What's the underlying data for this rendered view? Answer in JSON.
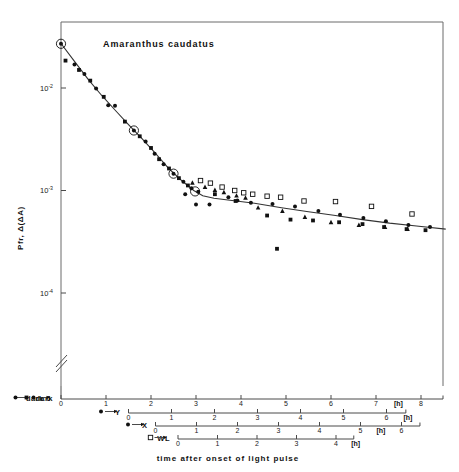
{
  "figure": {
    "title": "Amaranthus caudatus",
    "y_axis_title": "Pfr, Δ(ΔA)",
    "x_caption": "time after onset of light pulse",
    "unit_label": "[h]",
    "axis_break_symbol": "//"
  },
  "chart_data": {
    "type": "scatter",
    "title": "Amaranthus caudatus",
    "xlabel": "time after onset of light pulse",
    "ylabel": "Pfr, Δ(ΔA)",
    "yscale": "log",
    "ylim": [
      3e-05,
      0.04
    ],
    "ytick_values": [
      0.01,
      0.001,
      0.0001
    ],
    "ytick_labels": [
      "10-2",
      "10-3",
      "10-4"
    ],
    "ytick_exponents": [
      "-2",
      "-3",
      "-4"
    ],
    "ytick_mantissa": "10",
    "grid": false,
    "legend_position": "below-axes",
    "xlim_hours_dark": [
      0,
      8.6
    ],
    "time_axes": [
      {
        "name": "dark",
        "label": "dark",
        "marker_left": "filled-circle",
        "marker_right": "filled-square",
        "start_hour_on_dark_scale": 0,
        "ticks": [
          0,
          1,
          2,
          3,
          4,
          5,
          6,
          7,
          8
        ],
        "tick_labels": [
          "0",
          "1",
          "2",
          "3",
          "4",
          "5",
          "6",
          "7",
          "8"
        ],
        "unit": "[h]",
        "unit_after_tick": 7
      },
      {
        "name": "Y",
        "label": "Y",
        "marker_left": "filled-circle",
        "marker_right": "filled-triangle",
        "start_hour_on_dark_scale": 1.5,
        "ticks": [
          0,
          1,
          2,
          3,
          4,
          5,
          6
        ],
        "tick_labels": [
          "0",
          "1",
          "2",
          "3",
          "4",
          "5",
          "6"
        ],
        "unit": "[h]",
        "unit_after_tick": 6
      },
      {
        "name": "X",
        "label": "X",
        "marker_left": "filled-circle",
        "marker_right": "filled-square",
        "start_hour_on_dark_scale": 2.1,
        "ticks": [
          0,
          1,
          2,
          3,
          4,
          5,
          6
        ],
        "tick_labels": [
          "0",
          "1",
          "2",
          "3",
          "4",
          "5",
          "6"
        ],
        "unit": "[h]",
        "unit_after_tick": 5
      },
      {
        "name": "WL",
        "label": "WL",
        "marker_left": "open-square",
        "marker_right": "open-square",
        "start_hour_on_dark_scale": 2.6,
        "ticks": [
          0,
          1,
          2,
          3,
          4
        ],
        "tick_labels": [
          "0",
          "1",
          "2",
          "3",
          "4"
        ],
        "unit": "[h]",
        "unit_after_tick": 4
      }
    ],
    "series": [
      {
        "name": "dark",
        "marker": "filled-circle",
        "points": [
          [
            0.0,
            0.027
          ],
          [
            0.3,
            0.017
          ],
          [
            0.52,
            0.0137
          ],
          [
            0.78,
            0.0099
          ],
          [
            1.05,
            0.0068
          ],
          [
            1.2,
            0.0067
          ],
          [
            1.62,
            0.00385
          ],
          [
            1.88,
            0.003
          ],
          [
            2.08,
            0.00228
          ],
          [
            2.28,
            0.0018
          ],
          [
            2.5,
            0.00146
          ],
          [
            2.72,
            0.00122
          ],
          [
            2.9,
            0.00105
          ],
          [
            3.05,
            0.00097
          ],
          [
            2.76,
            0.00092
          ],
          [
            3.0,
            0.00073
          ],
          [
            3.3,
            0.00073
          ],
          [
            3.72,
            0.00086
          ],
          [
            3.92,
            0.0008
          ],
          [
            4.22,
            0.00076
          ],
          [
            4.7,
            0.00074
          ],
          [
            5.2,
            0.0007
          ],
          [
            5.72,
            0.00063
          ],
          [
            6.2,
            0.00058
          ],
          [
            6.72,
            0.00054
          ],
          [
            7.22,
            0.0005
          ],
          [
            7.72,
            0.00046
          ],
          [
            8.2,
            0.00044
          ]
        ]
      },
      {
        "name": "Y",
        "marker": "filled-triangle",
        "points": [
          [
            2.92,
            0.00119
          ],
          [
            3.2,
            0.00108
          ],
          [
            3.42,
            0.00101
          ],
          [
            3.62,
            0.00096
          ],
          [
            3.9,
            0.00089
          ],
          [
            4.1,
            0.00085
          ],
          [
            4.38,
            0.00068
          ],
          [
            4.92,
            0.00063
          ],
          [
            5.42,
            0.00055
          ],
          [
            6.0,
            0.00049
          ],
          [
            6.62,
            0.00046
          ],
          [
            7.2,
            0.00044
          ],
          [
            7.7,
            0.00042
          ]
        ]
      },
      {
        "name": "X",
        "marker": "filled-square",
        "points": [
          [
            0.1,
            0.0185
          ],
          [
            0.4,
            0.015
          ],
          [
            0.65,
            0.0118
          ],
          [
            0.95,
            0.0082
          ],
          [
            1.42,
            0.0047
          ],
          [
            1.75,
            0.00338
          ],
          [
            2.0,
            0.0026
          ],
          [
            2.18,
            0.00202
          ],
          [
            2.4,
            0.00164
          ],
          [
            2.62,
            0.00132
          ],
          [
            2.82,
            0.00112
          ],
          [
            3.42,
            0.00092
          ],
          [
            3.88,
            0.00079
          ],
          [
            4.58,
            0.00057
          ],
          [
            5.1,
            0.00052
          ],
          [
            5.6,
            0.00051
          ],
          [
            6.18,
            0.00049
          ],
          [
            6.7,
            0.00047
          ],
          [
            7.18,
            0.00044
          ],
          [
            7.68,
            0.00042
          ],
          [
            8.1,
            0.00041
          ],
          [
            4.8,
            0.00027
          ]
        ]
      },
      {
        "name": "WL",
        "marker": "open-square",
        "points": [
          [
            3.1,
            0.00125
          ],
          [
            3.32,
            0.00118
          ],
          [
            3.58,
            0.00108
          ],
          [
            3.86,
            0.001
          ],
          [
            4.06,
            0.00095
          ],
          [
            4.26,
            0.00092
          ],
          [
            4.58,
            0.00088
          ],
          [
            4.88,
            0.00086
          ],
          [
            5.4,
            0.00079
          ],
          [
            6.1,
            0.00078
          ],
          [
            6.9,
            0.0007
          ],
          [
            7.8,
            0.00059
          ]
        ]
      },
      {
        "name": "circled-highlight",
        "marker": "circled",
        "points": [
          [
            0.0,
            0.027
          ],
          [
            1.62,
            0.00385
          ],
          [
            2.5,
            0.00146
          ],
          [
            2.98,
            0.00098
          ]
        ]
      }
    ],
    "fit_curve": {
      "description": "smooth decay line through circled points",
      "points": [
        [
          0.0,
          0.0272
        ],
        [
          0.3,
          0.0182
        ],
        [
          0.6,
          0.0122
        ],
        [
          0.9,
          0.0085
        ],
        [
          1.2,
          0.0061
        ],
        [
          1.5,
          0.0044
        ],
        [
          1.8,
          0.0032
        ],
        [
          2.1,
          0.0023
        ],
        [
          2.4,
          0.00163
        ],
        [
          2.7,
          0.00123
        ],
        [
          2.95,
          0.001
        ],
        [
          3.15,
          0.00089
        ],
        [
          3.4,
          0.00084
        ],
        [
          3.8,
          0.0008
        ],
        [
          4.3,
          0.00075
        ],
        [
          4.9,
          0.00068
        ],
        [
          5.5,
          0.00062
        ],
        [
          6.1,
          0.00057
        ],
        [
          6.7,
          0.00052
        ],
        [
          7.3,
          0.00048
        ],
        [
          7.9,
          0.00045
        ],
        [
          8.55,
          0.00042
        ]
      ]
    }
  }
}
